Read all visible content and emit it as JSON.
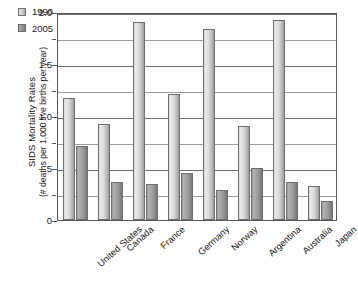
{
  "chart_data": {
    "type": "bar",
    "title": "",
    "xlabel": "",
    "ylabel": "SIDS Mortality Rates (# deaths per 1,000 live births per year)",
    "ylabel_line1": "SIDS Mortality Rates",
    "ylabel_line2": "(# deaths per 1,000 live births per year)",
    "categories": [
      "United States",
      "Canada",
      "France",
      "Germany",
      "Norway",
      "Argentina",
      "Australia",
      "Japan"
    ],
    "series": [
      {
        "name": "1990",
        "color": "#d2d2d2",
        "values": [
          1.17,
          0.92,
          1.9,
          1.21,
          1.84,
          0.9,
          1.92,
          0.33
        ]
      },
      {
        "name": "2005",
        "color": "#8f8f8f",
        "values": [
          0.71,
          0.37,
          0.35,
          0.45,
          0.29,
          0.5,
          0.37,
          0.18
        ]
      }
    ],
    "ylim": [
      0,
      2.0
    ],
    "ytick_values": [
      2.0,
      1.75,
      1.5,
      1.25,
      1.0,
      0.75,
      0.5,
      0.25,
      0
    ],
    "ytick_labels": [
      "2.0",
      "",
      "1.5",
      "",
      "1.0",
      "",
      ".5",
      "",
      "0"
    ],
    "grid": true,
    "grid_axis": "y",
    "legend_position": "top-left"
  },
  "legend": {
    "entries": [
      {
        "label": "1990"
      },
      {
        "label": "2005"
      }
    ]
  }
}
